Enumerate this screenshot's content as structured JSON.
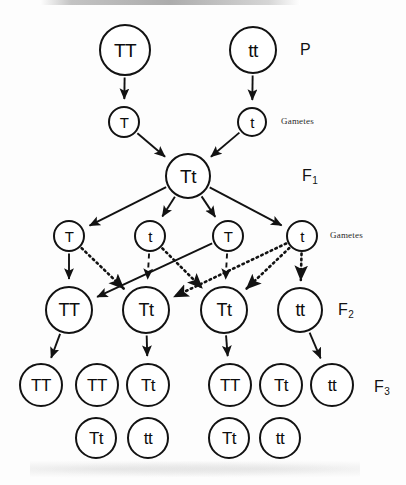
{
  "figure": {
    "stroke_color": "#121212",
    "background_color": "#ffffff"
  },
  "generation_labels": [
    {
      "name": "p-label",
      "text": "P",
      "sub": "",
      "x": 300,
      "y": 41
    },
    {
      "name": "f1-label",
      "text": "F",
      "sub": "1",
      "x": 302,
      "y": 167
    },
    {
      "name": "f2-label",
      "text": "F",
      "sub": "2",
      "x": 338,
      "y": 301
    },
    {
      "name": "f3-label",
      "text": "F",
      "sub": "3",
      "x": 374,
      "y": 378
    }
  ],
  "side_labels": [
    {
      "name": "gametes-label-p",
      "text": "Gametes",
      "x": 281,
      "y": 116
    },
    {
      "name": "gametes-label-f1",
      "text": "Gametes",
      "x": 330,
      "y": 230
    }
  ],
  "nodes": [
    {
      "name": "node-p-tt-dominant",
      "label": "TT",
      "cx": 125,
      "cy": 50,
      "r": 26,
      "fs": 19,
      "row": "P"
    },
    {
      "name": "node-p-tt-recessive",
      "label": "tt",
      "cx": 253,
      "cy": 50,
      "r": 24,
      "fs": 19,
      "row": "P"
    },
    {
      "name": "node-gamete-p-t-dom",
      "label": "T",
      "cx": 124,
      "cy": 122,
      "r": 16,
      "fs": 15,
      "row": "P-gametes"
    },
    {
      "name": "node-gamete-p-t-rec",
      "label": "t",
      "cx": 252,
      "cy": 122,
      "r": 15,
      "fs": 15,
      "row": "P-gametes"
    },
    {
      "name": "node-f1-tt",
      "label": "Tt",
      "cx": 188,
      "cy": 176,
      "r": 23,
      "fs": 19,
      "row": "F1"
    },
    {
      "name": "node-gamete-f1-t-1",
      "label": "T",
      "cx": 69,
      "cy": 236,
      "r": 16,
      "fs": 15,
      "row": "F1-gametes"
    },
    {
      "name": "node-gamete-f1-t-2",
      "label": "t",
      "cx": 150,
      "cy": 236,
      "r": 16,
      "fs": 15,
      "row": "F1-gametes"
    },
    {
      "name": "node-gamete-f1-t-3",
      "label": "T",
      "cx": 228,
      "cy": 236,
      "r": 16,
      "fs": 15,
      "row": "F1-gametes"
    },
    {
      "name": "node-gamete-f1-t-4",
      "label": "t",
      "cx": 302,
      "cy": 236,
      "r": 16,
      "fs": 15,
      "row": "F1-gametes"
    },
    {
      "name": "node-f2-1",
      "label": "TT",
      "cx": 69,
      "cy": 310,
      "r": 24,
      "fs": 18,
      "row": "F2"
    },
    {
      "name": "node-f2-2",
      "label": "Tt",
      "cx": 146,
      "cy": 310,
      "r": 24,
      "fs": 18,
      "row": "F2"
    },
    {
      "name": "node-f2-3",
      "label": "Tt",
      "cx": 224,
      "cy": 310,
      "r": 24,
      "fs": 18,
      "row": "F2"
    },
    {
      "name": "node-f2-4",
      "label": "tt",
      "cx": 300,
      "cy": 310,
      "r": 23,
      "fs": 18,
      "row": "F2"
    },
    {
      "name": "node-f3-1",
      "label": "TT",
      "cx": 41,
      "cy": 385,
      "r": 22,
      "fs": 17,
      "row": "F3"
    },
    {
      "name": "node-f3-2",
      "label": "TT",
      "cx": 97,
      "cy": 385,
      "r": 22,
      "fs": 17,
      "row": "F3"
    },
    {
      "name": "node-f3-3",
      "label": "Tt",
      "cx": 148,
      "cy": 385,
      "r": 22,
      "fs": 17,
      "row": "F3"
    },
    {
      "name": "node-f3-4",
      "label": "TT",
      "cx": 230,
      "cy": 385,
      "r": 22,
      "fs": 17,
      "row": "F3"
    },
    {
      "name": "node-f3-5",
      "label": "Tt",
      "cx": 281,
      "cy": 385,
      "r": 22,
      "fs": 17,
      "row": "F3"
    },
    {
      "name": "node-f3-6",
      "label": "tt",
      "cx": 332,
      "cy": 385,
      "r": 22,
      "fs": 17,
      "row": "F3"
    },
    {
      "name": "node-f3-7",
      "label": "Tt",
      "cx": 96,
      "cy": 438,
      "r": 21,
      "fs": 17,
      "row": "F3"
    },
    {
      "name": "node-f3-8",
      "label": "tt",
      "cx": 148,
      "cy": 438,
      "r": 21,
      "fs": 17,
      "row": "F3"
    },
    {
      "name": "node-f3-9",
      "label": "Tt",
      "cx": 229,
      "cy": 438,
      "r": 21,
      "fs": 17,
      "row": "F3"
    },
    {
      "name": "node-f3-10",
      "label": "tt",
      "cx": 280,
      "cy": 438,
      "r": 21,
      "fs": 17,
      "row": "F3"
    }
  ],
  "edges": [
    {
      "name": "edge-p-tt-to-gamete-t",
      "from": "node-p-tt-dominant",
      "to": "node-gamete-p-t-dom",
      "style": "solid",
      "arrow": true
    },
    {
      "name": "edge-p-tt-to-gamete-t2",
      "from": "node-p-tt-recessive",
      "to": "node-gamete-p-t-rec",
      "style": "solid",
      "arrow": true
    },
    {
      "name": "edge-gamete-t-to-f1",
      "from": "node-gamete-p-t-dom",
      "to": "node-f1-tt",
      "style": "solid",
      "arrow": true
    },
    {
      "name": "edge-gamete-t2-to-f1",
      "from": "node-gamete-p-t-rec",
      "to": "node-f1-tt",
      "style": "solid",
      "arrow": true
    },
    {
      "name": "edge-f1-to-gamete-1",
      "from": "node-f1-tt",
      "to": "node-gamete-f1-t-1",
      "style": "solid",
      "arrow": true
    },
    {
      "name": "edge-f1-to-gamete-2",
      "from": "node-f1-tt",
      "to": "node-gamete-f1-t-2",
      "style": "solid",
      "arrow": true
    },
    {
      "name": "edge-f1-to-gamete-3",
      "from": "node-f1-tt",
      "to": "node-gamete-f1-t-3",
      "style": "solid",
      "arrow": true
    },
    {
      "name": "edge-f1-to-gamete-4",
      "from": "node-f1-tt",
      "to": "node-gamete-f1-t-4",
      "style": "solid",
      "arrow": true
    },
    {
      "name": "edge-g1-to-f2-1",
      "from": "node-gamete-f1-t-1",
      "to": "node-f2-1",
      "style": "solid",
      "arrow": true
    },
    {
      "name": "edge-g1-to-f2-2",
      "from": "node-gamete-f1-t-1",
      "to": "node-f2-2",
      "style": "dotted",
      "arrow": true
    },
    {
      "name": "edge-g3-to-f2-1",
      "from": "node-gamete-f1-t-3",
      "to": "node-f2-1",
      "style": "solid",
      "arrow": true
    },
    {
      "name": "edge-g3-to-f2-3",
      "from": "node-gamete-f1-t-3",
      "to": "node-f2-3",
      "style": "dashed",
      "arrow": true
    },
    {
      "name": "edge-g2-to-f2-3",
      "from": "node-gamete-f1-t-2",
      "to": "node-f2-3",
      "style": "dotted",
      "arrow": true
    },
    {
      "name": "edge-g2-to-f2-2",
      "from": "node-gamete-f1-t-2",
      "to": "node-f2-2",
      "style": "dashed",
      "arrow": true
    },
    {
      "name": "edge-g4-to-f2-2",
      "from": "node-gamete-f1-t-4",
      "to": "node-f2-2",
      "style": "dotted",
      "arrow": true
    },
    {
      "name": "edge-g4-to-f2-4",
      "from": "node-gamete-f1-t-4",
      "to": "node-f2-4",
      "style": "dotted",
      "arrow": true
    },
    {
      "name": "edge-g4-to-f2-3",
      "from": "node-gamete-f1-t-4",
      "to": "node-f2-3",
      "style": "dotted",
      "arrow": true
    },
    {
      "name": "edge-f2-1-to-f3-1",
      "from": "node-f2-1",
      "to": "node-f3-1",
      "style": "solid",
      "arrow": true
    },
    {
      "name": "edge-f2-2-to-f3-3",
      "from": "node-f2-2",
      "to": "node-f3-3",
      "style": "solid",
      "arrow": true
    },
    {
      "name": "edge-f2-3-to-f3-4",
      "from": "node-f2-3",
      "to": "node-f3-4",
      "style": "solid",
      "arrow": true
    },
    {
      "name": "edge-f2-4-to-f3-6",
      "from": "node-f2-4",
      "to": "node-f3-6",
      "style": "solid",
      "arrow": true
    }
  ]
}
